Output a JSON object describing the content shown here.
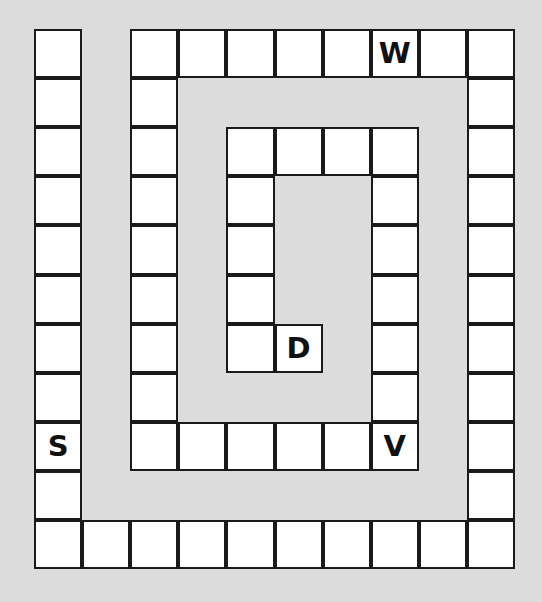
{
  "board": {
    "background_color": "#dcdcdc",
    "cell_color": "#ffffff",
    "line_color": "#1a1a1a",
    "origin": {
      "x": 34,
      "y": 29
    },
    "cell_width": 48.1,
    "cell_height": 49.1,
    "columns": 10,
    "rows": 11,
    "cells": [
      {
        "col": 0,
        "row": 0,
        "label": ""
      },
      {
        "col": 0,
        "row": 1,
        "label": ""
      },
      {
        "col": 0,
        "row": 2,
        "label": ""
      },
      {
        "col": 0,
        "row": 3,
        "label": ""
      },
      {
        "col": 0,
        "row": 4,
        "label": ""
      },
      {
        "col": 0,
        "row": 5,
        "label": ""
      },
      {
        "col": 0,
        "row": 6,
        "label": ""
      },
      {
        "col": 0,
        "row": 7,
        "label": ""
      },
      {
        "col": 0,
        "row": 8,
        "label": "S"
      },
      {
        "col": 0,
        "row": 9,
        "label": ""
      },
      {
        "col": 0,
        "row": 10,
        "label": ""
      },
      {
        "col": 1,
        "row": 10,
        "label": ""
      },
      {
        "col": 2,
        "row": 10,
        "label": ""
      },
      {
        "col": 3,
        "row": 10,
        "label": ""
      },
      {
        "col": 4,
        "row": 10,
        "label": ""
      },
      {
        "col": 5,
        "row": 10,
        "label": ""
      },
      {
        "col": 6,
        "row": 10,
        "label": ""
      },
      {
        "col": 7,
        "row": 10,
        "label": ""
      },
      {
        "col": 8,
        "row": 10,
        "label": ""
      },
      {
        "col": 9,
        "row": 10,
        "label": ""
      },
      {
        "col": 9,
        "row": 9,
        "label": ""
      },
      {
        "col": 9,
        "row": 8,
        "label": ""
      },
      {
        "col": 9,
        "row": 7,
        "label": ""
      },
      {
        "col": 9,
        "row": 6,
        "label": ""
      },
      {
        "col": 9,
        "row": 5,
        "label": ""
      },
      {
        "col": 9,
        "row": 4,
        "label": ""
      },
      {
        "col": 9,
        "row": 3,
        "label": ""
      },
      {
        "col": 9,
        "row": 2,
        "label": ""
      },
      {
        "col": 9,
        "row": 1,
        "label": ""
      },
      {
        "col": 9,
        "row": 0,
        "label": ""
      },
      {
        "col": 8,
        "row": 0,
        "label": ""
      },
      {
        "col": 7,
        "row": 0,
        "label": "W"
      },
      {
        "col": 6,
        "row": 0,
        "label": ""
      },
      {
        "col": 5,
        "row": 0,
        "label": ""
      },
      {
        "col": 4,
        "row": 0,
        "label": ""
      },
      {
        "col": 3,
        "row": 0,
        "label": ""
      },
      {
        "col": 2,
        "row": 0,
        "label": ""
      },
      {
        "col": 2,
        "row": 1,
        "label": ""
      },
      {
        "col": 2,
        "row": 2,
        "label": ""
      },
      {
        "col": 2,
        "row": 3,
        "label": ""
      },
      {
        "col": 2,
        "row": 4,
        "label": ""
      },
      {
        "col": 2,
        "row": 5,
        "label": ""
      },
      {
        "col": 2,
        "row": 6,
        "label": ""
      },
      {
        "col": 2,
        "row": 7,
        "label": ""
      },
      {
        "col": 2,
        "row": 8,
        "label": ""
      },
      {
        "col": 3,
        "row": 8,
        "label": ""
      },
      {
        "col": 4,
        "row": 8,
        "label": ""
      },
      {
        "col": 5,
        "row": 8,
        "label": ""
      },
      {
        "col": 6,
        "row": 8,
        "label": ""
      },
      {
        "col": 7,
        "row": 8,
        "label": "V"
      },
      {
        "col": 7,
        "row": 7,
        "label": ""
      },
      {
        "col": 7,
        "row": 6,
        "label": ""
      },
      {
        "col": 7,
        "row": 5,
        "label": ""
      },
      {
        "col": 7,
        "row": 4,
        "label": ""
      },
      {
        "col": 7,
        "row": 3,
        "label": ""
      },
      {
        "col": 7,
        "row": 2,
        "label": ""
      },
      {
        "col": 6,
        "row": 2,
        "label": ""
      },
      {
        "col": 5,
        "row": 2,
        "label": ""
      },
      {
        "col": 4,
        "row": 2,
        "label": ""
      },
      {
        "col": 4,
        "row": 3,
        "label": ""
      },
      {
        "col": 4,
        "row": 4,
        "label": ""
      },
      {
        "col": 4,
        "row": 5,
        "label": ""
      },
      {
        "col": 4,
        "row": 6,
        "label": ""
      },
      {
        "col": 5,
        "row": 6,
        "label": "D"
      }
    ]
  }
}
